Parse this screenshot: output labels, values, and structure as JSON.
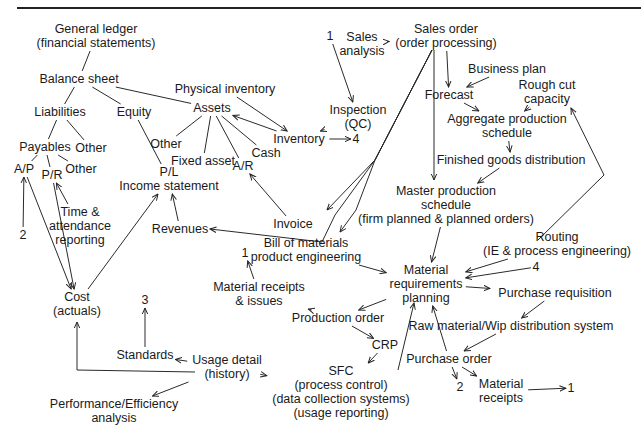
{
  "diagram": {
    "type": "flow",
    "nodes": [
      {
        "id": "general_ledger",
        "lines": [
          "General ledger",
          "(financial statements)"
        ]
      },
      {
        "id": "balance_sheet",
        "lines": [
          "Balance sheet"
        ]
      },
      {
        "id": "liabilities",
        "lines": [
          "Liabilities"
        ]
      },
      {
        "id": "equity",
        "lines": [
          "Equity"
        ]
      },
      {
        "id": "assets",
        "lines": [
          "Assets"
        ]
      },
      {
        "id": "payables",
        "lines": [
          "Payables"
        ]
      },
      {
        "id": "liab_other",
        "lines": [
          "Other"
        ]
      },
      {
        "id": "ap",
        "lines": [
          "A/P"
        ]
      },
      {
        "id": "pr",
        "lines": [
          "P/R"
        ]
      },
      {
        "id": "pay_other",
        "lines": [
          "Other"
        ]
      },
      {
        "id": "ref_2_left",
        "lines": [
          "2"
        ]
      },
      {
        "id": "time_attendance",
        "lines": [
          "Time &",
          "attendance",
          "reporting"
        ]
      },
      {
        "id": "assets_other",
        "lines": [
          "Other"
        ]
      },
      {
        "id": "fixed_asset",
        "lines": [
          "Fixed asset"
        ]
      },
      {
        "id": "ar",
        "lines": [
          "A/R"
        ]
      },
      {
        "id": "cash",
        "lines": [
          "Cash"
        ]
      },
      {
        "id": "pl",
        "lines": [
          "P/L",
          "Income statement"
        ]
      },
      {
        "id": "revenues",
        "lines": [
          "Revenues"
        ]
      },
      {
        "id": "cost",
        "lines": [
          "Cost",
          "(actuals)"
        ]
      },
      {
        "id": "ref_3",
        "lines": [
          "3"
        ]
      },
      {
        "id": "standards",
        "lines": [
          "Standards"
        ]
      },
      {
        "id": "usage_detail",
        "lines": [
          "Usage detail",
          "(history)"
        ]
      },
      {
        "id": "performance",
        "lines": [
          "Performance/Efficiency",
          "analysis"
        ]
      },
      {
        "id": "physical_inventory",
        "lines": [
          "Physical inventory"
        ]
      },
      {
        "id": "inventory",
        "lines": [
          "Inventory"
        ]
      },
      {
        "id": "ref_4_inv",
        "lines": [
          "4"
        ]
      },
      {
        "id": "ref_1_top",
        "lines": [
          "1"
        ]
      },
      {
        "id": "inspection",
        "lines": [
          "Inspection",
          "(QC)"
        ]
      },
      {
        "id": "sales_analysis",
        "lines": [
          "Sales",
          "analysis"
        ]
      },
      {
        "id": "sales_order",
        "lines": [
          "Sales order",
          "(order processing)"
        ]
      },
      {
        "id": "invoice",
        "lines": [
          "Invoice"
        ]
      },
      {
        "id": "bom",
        "lines": [
          "Bill of materials",
          "product engineering"
        ]
      },
      {
        "id": "ref_1_mr",
        "lines": [
          "1"
        ]
      },
      {
        "id": "material_receipts_issues",
        "lines": [
          "Material receipts",
          "& issues"
        ]
      },
      {
        "id": "production_order",
        "lines": [
          "Production order"
        ]
      },
      {
        "id": "crp",
        "lines": [
          "CRP"
        ]
      },
      {
        "id": "sfc",
        "lines": [
          "SFC",
          "(process control)",
          "(data collection systems)",
          "(usage reporting)"
        ]
      },
      {
        "id": "business_plan",
        "lines": [
          "Business plan"
        ]
      },
      {
        "id": "forecast",
        "lines": [
          "Forecast"
        ]
      },
      {
        "id": "rough_cut",
        "lines": [
          "Rough cut",
          "capacity"
        ]
      },
      {
        "id": "aggregate",
        "lines": [
          "Aggregate production",
          "schedule"
        ]
      },
      {
        "id": "finished_goods",
        "lines": [
          "Finished goods distribution"
        ]
      },
      {
        "id": "mps",
        "lines": [
          "Master production",
          "schedule",
          "(firm planned & planned orders)"
        ]
      },
      {
        "id": "routing",
        "lines": [
          "Routing",
          "(IE & process engineering)"
        ]
      },
      {
        "id": "ref_4_mrp",
        "lines": [
          "4"
        ]
      },
      {
        "id": "mrp",
        "lines": [
          "Material",
          "requirements",
          "planning"
        ]
      },
      {
        "id": "purchase_requisition",
        "lines": [
          "Purchase requisition"
        ]
      },
      {
        "id": "raw_material",
        "lines": [
          "Raw material/Wip distribution system"
        ]
      },
      {
        "id": "purchase_order",
        "lines": [
          "Purchase order"
        ]
      },
      {
        "id": "ref_2_po",
        "lines": [
          "2"
        ]
      },
      {
        "id": "material_receipts",
        "lines": [
          "Material",
          "receipts"
        ]
      },
      {
        "id": "ref_1_bottom",
        "lines": [
          "1"
        ]
      }
    ],
    "edges": [
      {
        "from": "general_ledger",
        "to": "balance_sheet",
        "arrow": false
      },
      {
        "from": "balance_sheet",
        "to": "liabilities",
        "arrow": false
      },
      {
        "from": "balance_sheet",
        "to": "equity",
        "arrow": false
      },
      {
        "from": "balance_sheet",
        "to": "assets",
        "arrow": false
      },
      {
        "from": "liabilities",
        "to": "payables",
        "arrow": false
      },
      {
        "from": "liabilities",
        "to": "liab_other",
        "arrow": false
      },
      {
        "from": "payables",
        "to": "ap",
        "arrow": false
      },
      {
        "from": "payables",
        "to": "pr",
        "arrow": false
      },
      {
        "from": "payables",
        "to": "pay_other",
        "arrow": false
      },
      {
        "from": "ref_2_left",
        "to": "ap",
        "arrow": true
      },
      {
        "from": "time_attendance",
        "to": "pr",
        "arrow": true
      },
      {
        "from": "ap",
        "to": "cost",
        "arrow": true
      },
      {
        "from": "pr",
        "to": "cost",
        "arrow": true
      },
      {
        "from": "equity",
        "to": "pl",
        "arrow": false
      },
      {
        "from": "assets",
        "to": "assets_other",
        "arrow": false
      },
      {
        "from": "assets",
        "to": "fixed_asset",
        "arrow": false
      },
      {
        "from": "assets",
        "to": "ar",
        "arrow": false
      },
      {
        "from": "assets",
        "to": "cash",
        "arrow": false
      },
      {
        "from": "inventory",
        "to": "assets",
        "arrow": true
      },
      {
        "from": "physical_inventory",
        "to": "inventory",
        "arrow": true
      },
      {
        "from": "inspection",
        "to": "inventory",
        "arrow": true
      },
      {
        "from": "inventory",
        "to": "ref_4_inv",
        "arrow": true
      },
      {
        "from": "ref_1_top",
        "to": "inspection",
        "arrow": true
      },
      {
        "from": "sales_order",
        "to": "sales_analysis",
        "arrow": true
      },
      {
        "from": "sales_order",
        "to": "invoice",
        "arrow": true
      },
      {
        "from": "sales_order",
        "to": "bom",
        "arrow": true
      },
      {
        "from": "sales_order",
        "to": "revenues",
        "arrow": true
      },
      {
        "from": "sales_order",
        "to": "mps",
        "arrow": true
      },
      {
        "from": "sales_order",
        "to": "forecast",
        "arrow": true
      },
      {
        "from": "invoice",
        "to": "ar",
        "arrow": true
      },
      {
        "from": "revenues",
        "to": "pl",
        "arrow": true
      },
      {
        "from": "cost",
        "to": "pl",
        "arrow": true
      },
      {
        "from": "standards",
        "to": "ref_3",
        "arrow": true
      },
      {
        "from": "usage_detail",
        "to": "standards",
        "arrow": true
      },
      {
        "from": "usage_detail",
        "to": "cost",
        "arrow": true
      },
      {
        "from": "usage_detail",
        "to": "performance",
        "arrow": true
      },
      {
        "from": "business_plan",
        "to": "forecast",
        "arrow": true
      },
      {
        "from": "forecast",
        "to": "aggregate",
        "arrow": true
      },
      {
        "from": "rough_cut",
        "to": "aggregate",
        "arrow": true
      },
      {
        "from": "aggregate",
        "to": "finished_goods",
        "arrow": true
      },
      {
        "from": "finished_goods",
        "to": "mps",
        "arrow": true
      },
      {
        "from": "mps",
        "to": "mrp",
        "arrow": true
      },
      {
        "from": "routing",
        "to": "rough_cut",
        "arrow": true
      },
      {
        "from": "routing",
        "to": "mrp",
        "arrow": true
      },
      {
        "from": "ref_4_mrp",
        "to": "mrp",
        "arrow": true
      },
      {
        "from": "bom",
        "to": "mrp",
        "arrow": true
      },
      {
        "from": "mrp",
        "to": "purchase_requisition",
        "arrow": true
      },
      {
        "from": "mrp",
        "to": "production_order",
        "arrow": true
      },
      {
        "from": "purchase_requisition",
        "to": "raw_material",
        "arrow": true
      },
      {
        "from": "raw_material",
        "to": "purchase_order",
        "arrow": true
      },
      {
        "from": "purchase_order",
        "to": "mrp",
        "arrow": true
      },
      {
        "from": "purchase_order",
        "to": "ref_2_po",
        "arrow": true
      },
      {
        "from": "purchase_order",
        "to": "material_receipts",
        "arrow": true
      },
      {
        "from": "material_receipts",
        "to": "ref_1_bottom",
        "arrow": true
      },
      {
        "from": "production_order",
        "to": "material_receipts_issues",
        "arrow": true
      },
      {
        "from": "material_receipts_issues",
        "to": "ref_1_mr",
        "arrow": true
      },
      {
        "from": "production_order",
        "to": "crp",
        "arrow": true
      },
      {
        "from": "crp",
        "to": "sfc",
        "arrow": true
      },
      {
        "from": "sfc",
        "to": "usage_detail",
        "arrow": true
      },
      {
        "from": "sfc",
        "to": "mrp",
        "arrow": true
      }
    ]
  }
}
